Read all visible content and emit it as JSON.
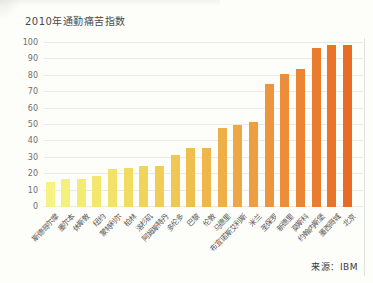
{
  "chart_data": {
    "type": "bar",
    "title": "2010年通勤痛苦指数",
    "source": "来源：IBM",
    "categories": [
      "斯德哥尔摩",
      "墨尔本",
      "休斯敦",
      "纽约",
      "蒙特利尔",
      "柏林",
      "洛杉矶",
      "阿姆斯特丹",
      "多伦多",
      "巴黎",
      "伦敦",
      "马德里",
      "布宜诺斯艾利斯",
      "米兰",
      "圣保罗",
      "新德里",
      "莫斯科",
      "约翰内斯堡",
      "墨西哥城",
      "北京"
    ],
    "values": [
      15,
      17,
      17,
      19,
      23,
      24,
      25,
      25,
      32,
      36,
      36,
      48,
      50,
      52,
      75,
      81,
      84,
      97,
      99,
      99
    ],
    "bar_colors": [
      "#F6F284",
      "#F5EF7C",
      "#F4EB74",
      "#F3E76D",
      "#F2E267",
      "#F1DC60",
      "#F0D55B",
      "#F0CE56",
      "#EFC752",
      "#EFBF4E",
      "#EFB74B",
      "#EFAF47",
      "#EFA644",
      "#EE9E40",
      "#ED953C",
      "#EC8D38",
      "#EB8433",
      "#EA7C2E",
      "#E9742A",
      "#E86C26"
    ],
    "y_ticks": [
      0,
      10,
      20,
      30,
      40,
      50,
      60,
      70,
      80,
      90,
      100
    ],
    "ylim": [
      0,
      100
    ],
    "xlabel": "",
    "ylabel": "",
    "legend": "none",
    "grid": "horizontal",
    "colors": {
      "gridline": "#eaeae5",
      "title_text": "#4a4a4a",
      "tick_text": "#6f6f6f",
      "source_text": "#3a3a3a"
    }
  }
}
